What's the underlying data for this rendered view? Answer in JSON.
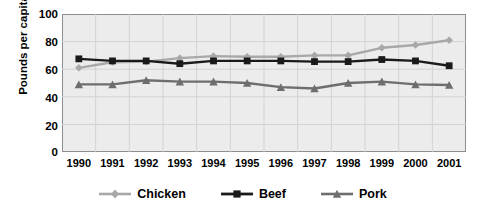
{
  "chart_data": {
    "type": "line",
    "title": "",
    "xlabel": "",
    "ylabel": "Pounds per capita",
    "categories": [
      "1990",
      "1991",
      "1992",
      "1993",
      "1994",
      "1995",
      "1996",
      "1997",
      "1998",
      "1999",
      "2000",
      "2001"
    ],
    "ylim": [
      0,
      100
    ],
    "yticks": [
      0,
      20,
      40,
      60,
      80,
      100
    ],
    "grid": true,
    "legend_position": "bottom",
    "plot_background": "#ececed",
    "series": [
      {
        "name": "Chicken",
        "color": "#a8a8a8",
        "marker": "diamond",
        "values": [
          61,
          65,
          65.5,
          68,
          69.5,
          69,
          69,
          70,
          70,
          75.5,
          77.5,
          81
        ]
      },
      {
        "name": "Beef",
        "color": "#1a1a1a",
        "marker": "square",
        "values": [
          67.5,
          66,
          66,
          64,
          66,
          66,
          66,
          65.5,
          65.5,
          67,
          66,
          62.5
        ]
      },
      {
        "name": "Pork",
        "color": "#6e6e6e",
        "marker": "triangle",
        "values": [
          49,
          49,
          52,
          51,
          51,
          50,
          47,
          46,
          50,
          51,
          49,
          48.5
        ]
      }
    ]
  },
  "axis": {
    "y_tick_labels": [
      "100",
      "80",
      "60",
      "40",
      "20",
      "0"
    ],
    "y_axis_title": "Pounds per capita"
  },
  "legend": {
    "entries": [
      {
        "label": "Chicken"
      },
      {
        "label": "Beef"
      },
      {
        "label": "Pork"
      }
    ]
  }
}
